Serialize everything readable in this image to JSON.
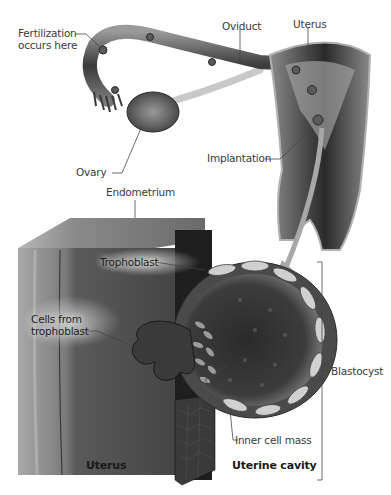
{
  "figure": {
    "type": "anatomical-illustration",
    "color_scheme": "grayscale",
    "top_panel": {
      "labels": {
        "fertilization": [
          "Fertilization",
          "occurs here"
        ],
        "oviduct": "Oviduct",
        "uterus": "Uterus",
        "ovary": "Ovary",
        "implantation": "Implantation"
      }
    },
    "bottom_panel": {
      "labels": {
        "endometrium": "Endometrium",
        "trophoblast": "Trophoblast",
        "cells_from_trophoblast": [
          "Cells from",
          "trophoblast"
        ],
        "blastocyst": "Blastocyst",
        "inner_cell_mass": "Inner cell mass",
        "uterus": "Uterus",
        "uterine_cavity": "Uterine cavity"
      }
    },
    "colors": {
      "tissue_dark": "#2e2e2e",
      "tissue_mid": "#6a6a6a",
      "tissue_light": "#b8b8b8",
      "leader_line": "#444444",
      "arrow": "#9a9a9a"
    }
  }
}
